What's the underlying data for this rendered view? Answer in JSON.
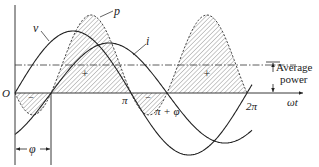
{
  "figure": {
    "type": "ac-power-waveforms",
    "labels": {
      "voltage": "v",
      "current": "i",
      "power": "p",
      "origin": "O",
      "pi": "π",
      "pi_plus_phi": "π + φ",
      "two_pi": "2π",
      "time_axis": "ωt",
      "phase": "φ",
      "positive_sign": "+",
      "negative_sign": "−",
      "average_power_line1": "Average",
      "average_power_line2": "power"
    },
    "params": {
      "origin_x": 15,
      "axis_y": 93,
      "pi_px": 116,
      "phi_px": 36,
      "v_amplitude_px": 62,
      "i_amplitude_px": 50,
      "p_peak_px": 78,
      "x_end": 252
    },
    "colors": {
      "stroke": "#222222",
      "hatch": "#555555",
      "background": "#ffffff"
    }
  }
}
